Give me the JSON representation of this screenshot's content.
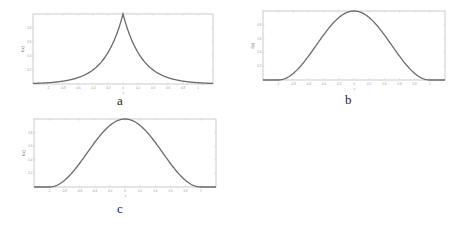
{
  "chart_data": [
    {
      "id": "a",
      "type": "line",
      "caption": "a",
      "title": "",
      "xlabel": "x",
      "ylabel": "f(x)",
      "xlim": [
        -1.2,
        1.2
      ],
      "ylim": [
        0,
        1
      ],
      "grid": false,
      "x_ticks": [
        -1,
        -0.8,
        -0.6,
        -0.4,
        -0.2,
        0,
        0.2,
        0.4,
        0.6,
        0.8,
        1
      ],
      "x_tick_labels": [
        "-1",
        "-0.8",
        "-0.6",
        "-0.4",
        "-0.2",
        "0",
        "0.2",
        "0.4",
        "0.6",
        "0.8",
        "1"
      ],
      "y_ticks": [
        0.2,
        0.4,
        0.6,
        0.8
      ],
      "y_tick_labels": [
        "0.2",
        "0.4",
        "0.6",
        "0.8"
      ],
      "shape": "cusp exponential decay",
      "series": [
        {
          "name": "f(x)",
          "x": [
            -1.2,
            -1,
            -0.8,
            -0.6,
            -0.4,
            -0.2,
            0,
            0.2,
            0.4,
            0.6,
            0.8,
            1,
            1.2
          ],
          "y": [
            0.0,
            0.02,
            0.04,
            0.09,
            0.2,
            0.45,
            1.0,
            0.45,
            0.2,
            0.09,
            0.04,
            0.02,
            0.0
          ]
        }
      ]
    },
    {
      "id": "b",
      "type": "line",
      "caption": "b",
      "title": "",
      "xlabel": "x",
      "ylabel": "f(x)",
      "xlim": [
        -1.2,
        1.2
      ],
      "ylim": [
        0,
        1
      ],
      "grid": false,
      "x_ticks": [
        -1,
        -0.8,
        -0.6,
        -0.4,
        -0.2,
        0,
        0.2,
        0.4,
        0.6,
        0.8,
        1
      ],
      "x_tick_labels": [
        "-1",
        "-0.8",
        "-0.6",
        "-0.4",
        "-0.2",
        "0",
        "0.2",
        "0.4",
        "0.6",
        "0.8",
        "1"
      ],
      "y_ticks": [
        0.2,
        0.4,
        0.6,
        0.8
      ],
      "y_tick_labels": [
        "0.2",
        "0.4",
        "0.6",
        "0.8"
      ],
      "shape": "smooth bump (raised cosine)",
      "series": [
        {
          "name": "f(x)",
          "x": [
            -1.2,
            -1,
            -0.8,
            -0.6,
            -0.4,
            -0.2,
            0,
            0.2,
            0.4,
            0.6,
            0.8,
            1,
            1.2
          ],
          "y": [
            0.0,
            0.0,
            0.1,
            0.35,
            0.65,
            0.9,
            1.0,
            0.9,
            0.65,
            0.35,
            0.1,
            0.0,
            0.0
          ]
        }
      ]
    },
    {
      "id": "c",
      "type": "line",
      "caption": "c",
      "title": "",
      "xlabel": "x",
      "ylabel": "f(x)",
      "xlim": [
        -1.2,
        1.2
      ],
      "ylim": [
        0,
        1
      ],
      "grid": false,
      "x_ticks": [
        -1,
        -0.8,
        -0.6,
        -0.4,
        -0.2,
        0,
        0.2,
        0.4,
        0.6,
        0.8,
        1
      ],
      "x_tick_labels": [
        "-1",
        "-0.8",
        "-0.6",
        "-0.4",
        "-0.2",
        "0",
        "0.2",
        "0.4",
        "0.6",
        "0.8",
        "1"
      ],
      "y_ticks": [
        0.2,
        0.4,
        0.6,
        0.8
      ],
      "y_tick_labels": [
        "0.2",
        "0.4",
        "0.6",
        "0.8"
      ],
      "shape": "smooth bump (raised cosine)",
      "series": [
        {
          "name": "f(x)",
          "x": [
            -1.2,
            -1,
            -0.8,
            -0.6,
            -0.4,
            -0.2,
            0,
            0.2,
            0.4,
            0.6,
            0.8,
            1,
            1.2
          ],
          "y": [
            0.0,
            0.0,
            0.1,
            0.35,
            0.65,
            0.9,
            1.0,
            0.9,
            0.65,
            0.35,
            0.1,
            0.0,
            0.0
          ]
        }
      ]
    }
  ],
  "captions": {
    "a": "a",
    "b": "b",
    "c": "c"
  },
  "colors": {
    "curve": "#6a6a6a",
    "frame": "#bdbdbd",
    "background": "#ffffff"
  }
}
